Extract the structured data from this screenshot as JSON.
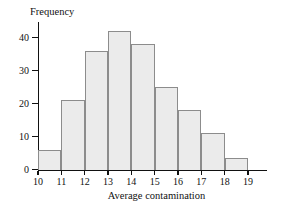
{
  "chart_data": {
    "type": "bar",
    "title": "",
    "xlabel": "Average contamination",
    "ylabel": "Frequency",
    "categories": [
      "10-11",
      "11-12",
      "12-13",
      "13-14",
      "14-15",
      "15-16",
      "16-17",
      "17-18",
      "18-19"
    ],
    "bin_edges": [
      10,
      11,
      12,
      13,
      14,
      15,
      16,
      17,
      18,
      19
    ],
    "values": [
      6,
      21,
      36,
      42,
      38,
      25,
      18,
      11,
      3.5
    ],
    "xlim": [
      10,
      19
    ],
    "ylim": [
      0,
      44
    ],
    "xticks": [
      10,
      11,
      12,
      13,
      14,
      15,
      16,
      17,
      18,
      19
    ],
    "yticks": [
      0,
      10,
      20,
      30,
      40
    ],
    "xtick_labels": [
      "10",
      "11",
      "12",
      "13",
      "14",
      "15",
      "16",
      "17",
      "18",
      "19"
    ],
    "ytick_labels": [
      "0",
      "10",
      "20",
      "30",
      "40"
    ],
    "grid": false,
    "legend": false,
    "bar_fill_color": "#ebebeb",
    "bar_edge_color": "#8c8c8c",
    "axis_color": "#111111"
  }
}
